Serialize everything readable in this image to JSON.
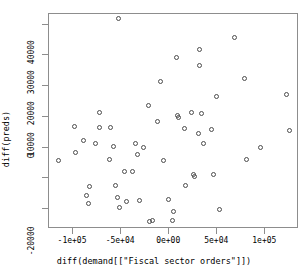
{
  "chart_data": {
    "type": "scatter",
    "title": "",
    "xlabel": "diff(demand[[\"Fiscal sector orders\"]])",
    "ylabel": "diff(preds)",
    "xlim": [
      -125000,
      135000
    ],
    "ylim": [
      -26500,
      43500
    ],
    "grid": false,
    "legend": "none",
    "x_ticks": [
      {
        "value": -100000,
        "label": "-1e+05"
      },
      {
        "value": -50000,
        "label": "-5e+04"
      },
      {
        "value": 0,
        "label": "0e+00"
      },
      {
        "value": 50000,
        "label": "5e+04"
      },
      {
        "value": 100000,
        "label": "1e+05"
      }
    ],
    "y_ticks": [
      {
        "value": 40000,
        "label": "40000"
      },
      {
        "value": 30000,
        "label": "30000"
      },
      {
        "value": 20000,
        "label": "20000"
      },
      {
        "value": 10000,
        "label": "10000"
      },
      {
        "value": 0,
        "label": "0"
      },
      {
        "value": -10000,
        "label": ""
      },
      {
        "value": -20000,
        "label": "-20000"
      }
    ],
    "marker": {
      "shape": "open-circle",
      "color": "#4c4c4c",
      "size_px": 5
    },
    "points": [
      [
        -53000,
        42100
      ],
      [
        -115000,
        -4200
      ],
      [
        -98000,
        6800
      ],
      [
        -97000,
        -1700
      ],
      [
        -89000,
        2400
      ],
      [
        -86000,
        -15500
      ],
      [
        -84000,
        -18300
      ],
      [
        -83000,
        -12700
      ],
      [
        -77000,
        1400
      ],
      [
        -73000,
        11400
      ],
      [
        -72000,
        6600
      ],
      [
        -61000,
        6600
      ],
      [
        -62000,
        -3900
      ],
      [
        -58000,
        400
      ],
      [
        -56000,
        -12400
      ],
      [
        -54000,
        -16200
      ],
      [
        -52000,
        -19600
      ],
      [
        -47000,
        -7800
      ],
      [
        -44000,
        -17500
      ],
      [
        -38000,
        -7900
      ],
      [
        -35000,
        1200
      ],
      [
        -33000,
        -2100
      ],
      [
        -31000,
        -17200
      ],
      [
        -27000,
        0
      ],
      [
        -22000,
        13600
      ],
      [
        -20000,
        -24200
      ],
      [
        -17000,
        -23800
      ],
      [
        -12000,
        8600
      ],
      [
        -9000,
        21400
      ],
      [
        -6000,
        -4200
      ],
      [
        -1000,
        -17000
      ],
      [
        3000,
        -23700
      ],
      [
        4000,
        -20800
      ],
      [
        8000,
        29300
      ],
      [
        9000,
        10300
      ],
      [
        9500,
        9700
      ],
      [
        16000,
        6100
      ],
      [
        17000,
        -12200
      ],
      [
        23000,
        11300
      ],
      [
        25000,
        -8600
      ],
      [
        26000,
        -9500
      ],
      [
        30000,
        4500
      ],
      [
        31000,
        31800
      ],
      [
        32000,
        26700
      ],
      [
        34000,
        11200
      ],
      [
        36000,
        1200
      ],
      [
        44000,
        6000
      ],
      [
        46000,
        -8700
      ],
      [
        49000,
        16800
      ],
      [
        52000,
        -20300
      ],
      [
        68000,
        35800
      ],
      [
        78000,
        22500
      ],
      [
        80000,
        -3900
      ],
      [
        95000,
        0
      ],
      [
        122000,
        17400
      ],
      [
        125000,
        5500
      ]
    ]
  }
}
